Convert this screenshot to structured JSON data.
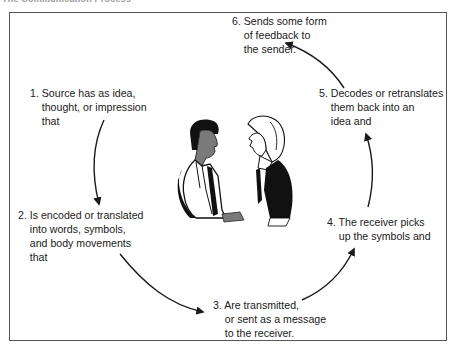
{
  "caption": "The Communication Process",
  "steps": [
    {
      "num": "1.",
      "text": "1. Source has as idea,\n    thought, or impression\n    that"
    },
    {
      "num": "2.",
      "text": "2. Is encoded or translated\n    into words, symbols,\n    and body movements\n    that"
    },
    {
      "num": "3.",
      "text": "3. Are transmitted,\n    or sent as a message\n    to the receiver."
    },
    {
      "num": "4.",
      "text": "4. The receiver picks\n    up the symbols and"
    },
    {
      "num": "5.",
      "text": "5. Decodes or retranslates\n    them back into an\n    idea and"
    },
    {
      "num": "6.",
      "text": "6. Sends some form\n    of feedback to\n    the sender."
    }
  ],
  "illustration": {
    "description": "sender-and-receiver-figures",
    "colors": {
      "ink": "#111111",
      "shade": "#7a7a7a"
    }
  },
  "arrow_color": "#1a1a1a"
}
